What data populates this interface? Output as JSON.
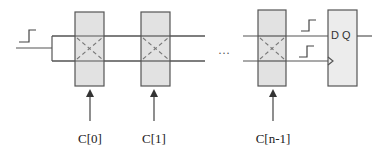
{
  "diagram": {
    "cells": [
      {
        "id": "cell-0",
        "control_label": "C[0]"
      },
      {
        "id": "cell-1",
        "control_label": "C[1]"
      },
      {
        "id": "cell-n-1",
        "control_label": "C[n-1]"
      }
    ],
    "ellipsis": "…",
    "flipflop": {
      "label": "D Q"
    },
    "colors": {
      "cell_fill": "#e2e2e2",
      "stroke": "#555555",
      "cross": "#777777"
    }
  }
}
